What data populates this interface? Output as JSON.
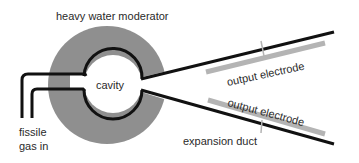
{
  "diagram": {
    "labels": {
      "moderator": "heavy water moderator",
      "cavity": "cavity",
      "gas_in_line1": "fissile",
      "gas_in_line2": "gas in",
      "electrode_top": "output electrode",
      "electrode_bottom": "output electrode",
      "duct": "expansion duct"
    },
    "colors": {
      "moderator": "#8f8f8f",
      "electrode": "#b4b4b4",
      "line": "#111111",
      "text": "#2a2a2a",
      "background": "#ffffff"
    }
  }
}
